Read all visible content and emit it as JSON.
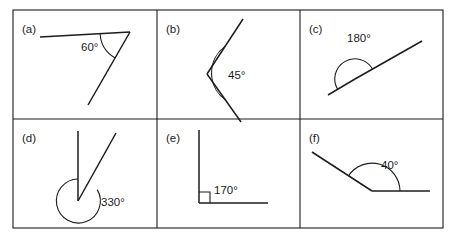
{
  "worksheet": {
    "title": "Angle identification worksheet",
    "background_color": "#ffffff",
    "ink_color": "#1c1c1c",
    "grid": {
      "columns": 3,
      "rows": 2,
      "left": 13,
      "top": 10,
      "right": 443,
      "bottom": 228,
      "v_divider_1": 157,
      "v_divider_2": 300,
      "h_divider_1": 119
    }
  },
  "panels": [
    {
      "id": "a",
      "panel_label": "(a)",
      "angle_value": "60°",
      "angle_degrees": 60,
      "angle_type": "acute",
      "marker": "arc",
      "vertex": {
        "x": 130,
        "y": 32
      },
      "rays": [
        {
          "to_x": 40,
          "to_y": 37
        },
        {
          "to_x": 88,
          "to_y": 105
        }
      ],
      "label_pos": {
        "x": 81,
        "y": 51
      },
      "arc_radius": 30
    },
    {
      "id": "b",
      "panel_label": "(b)",
      "angle_value": "45°",
      "angle_degrees": 45,
      "angle_type": "acute",
      "marker": "arc",
      "vertex": {
        "x": 207,
        "y": 74
      },
      "rays": [
        {
          "to_x": 243,
          "to_y": 19
        },
        {
          "to_x": 241,
          "to_y": 122
        }
      ],
      "label_pos": {
        "x": 228,
        "y": 79
      },
      "arc_radius": 33
    },
    {
      "id": "c",
      "panel_label": "(c)",
      "angle_value": "180°",
      "angle_degrees": 180,
      "angle_type": "straight",
      "marker": "semicircle",
      "vertex": {
        "x": 355,
        "y": 79
      },
      "rays": [
        {
          "to_x": 328,
          "to_y": 95
        },
        {
          "to_x": 422,
          "to_y": 41
        }
      ],
      "label_pos": {
        "x": 347,
        "y": 42
      },
      "arc_radius": 20
    },
    {
      "id": "d",
      "panel_label": "(d)",
      "angle_value": "330°",
      "angle_degrees": 330,
      "angle_type": "reflex",
      "marker": "reflex-arc",
      "vertex": {
        "x": 78,
        "y": 201
      },
      "rays": [
        {
          "to_x": 78,
          "to_y": 131
        },
        {
          "to_x": 116,
          "to_y": 133
        }
      ],
      "label_pos": {
        "x": 101,
        "y": 206
      },
      "arc_radius": 22
    },
    {
      "id": "e",
      "panel_label": "(e)",
      "angle_value": "170°",
      "angle_degrees": 170,
      "angle_type": "right",
      "marker": "square",
      "vertex": {
        "x": 199,
        "y": 203
      },
      "rays": [
        {
          "to_x": 199,
          "to_y": 130
        },
        {
          "to_x": 268,
          "to_y": 203
        }
      ],
      "label_pos": {
        "x": 214,
        "y": 194
      },
      "square_size": 11
    },
    {
      "id": "f",
      "panel_label": "(f)",
      "angle_value": "40°",
      "angle_degrees": 40,
      "angle_type": "obtuse",
      "marker": "arc",
      "vertex": {
        "x": 372,
        "y": 191
      },
      "rays": [
        {
          "to_x": 312,
          "to_y": 152
        },
        {
          "to_x": 430,
          "to_y": 191
        }
      ],
      "label_pos": {
        "x": 381,
        "y": 169
      },
      "arc_radius": 28
    }
  ],
  "panel_labels": {
    "a": "(a)",
    "b": "(b)",
    "c": "(c)",
    "d": "(d)",
    "e": "(e)",
    "f": "(f)"
  },
  "angle_labels": {
    "a": "60°",
    "b": "45°",
    "c": "180°",
    "d": "330°",
    "e": "170°",
    "f": "40°"
  }
}
